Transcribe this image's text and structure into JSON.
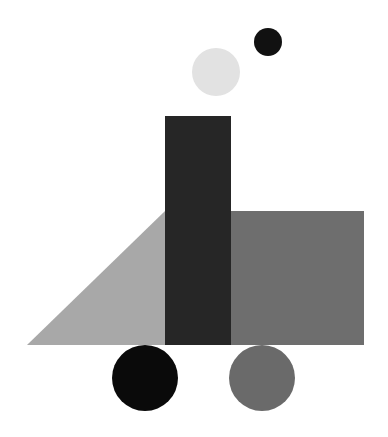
{
  "scene": {
    "description": "Abstract geometric composition resembling a locomotive with smoke",
    "background": "#ffffff",
    "shapes": {
      "smoke_small": {
        "cx": 268,
        "cy": 42,
        "r": 14,
        "color": "#111111"
      },
      "smoke_large": {
        "cx": 216,
        "cy": 72,
        "r": 24,
        "color": "#e2e2e2"
      },
      "chimney_rect": {
        "x": 165,
        "y": 116,
        "w": 66,
        "h": 229,
        "color": "#262626"
      },
      "cab_rect": {
        "x": 231,
        "y": 211,
        "w": 133,
        "h": 134,
        "color": "#6e6e6e"
      },
      "cowcatcher_triangle": {
        "points": "27,345 165,211 165,345",
        "color": "#a8a8a8"
      },
      "wheel_left": {
        "cx": 145,
        "cy": 378,
        "r": 33,
        "color": "#0a0a0a"
      },
      "wheel_right": {
        "cx": 262,
        "cy": 378,
        "r": 33,
        "color": "#6a6a6a"
      }
    }
  }
}
